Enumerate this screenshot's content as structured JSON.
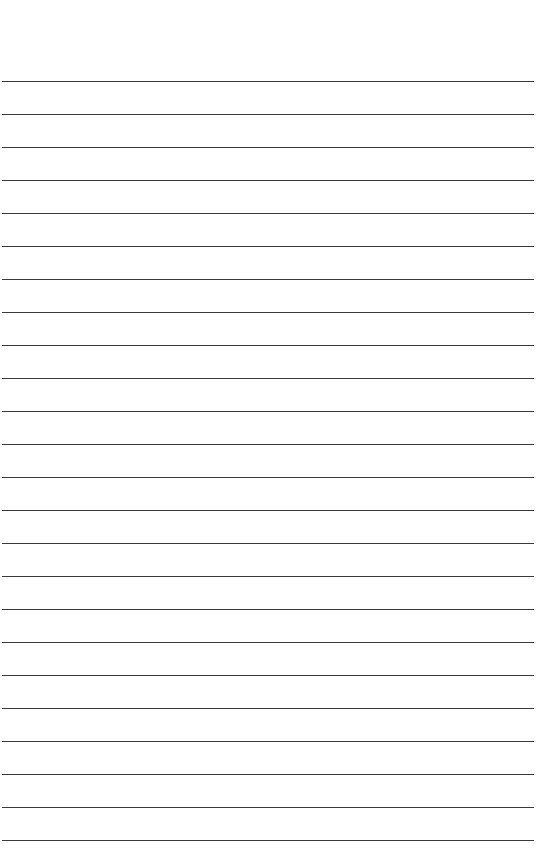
{
  "page": {
    "width": 539,
    "height": 864,
    "background": "#ffffff",
    "rule_color": "#3a3a3a",
    "first_rule_y": 81,
    "rule_spacing": 33,
    "rule_count": 24,
    "rule_left": 2,
    "rule_right": 534
  }
}
